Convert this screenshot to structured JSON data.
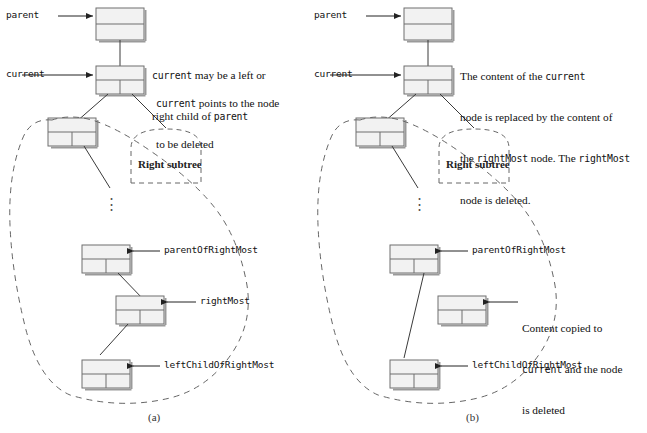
{
  "figure": {
    "colors": {
      "node_fill": "#f2f2f2",
      "node_stroke": "#6f6f6f",
      "node_shadow": "#8c8c8c",
      "line": "#3a3a3a",
      "dashed": "#666666",
      "text": "#111111",
      "background": "#ffffff"
    }
  },
  "panels": [
    {
      "id": "a",
      "caption": "(a)",
      "pointer_labels": [
        {
          "name": "parent-label",
          "text": "parent"
        },
        {
          "name": "current-label",
          "text": "current"
        },
        {
          "name": "parentofrightmost-label",
          "text": "parentOfRightMost"
        },
        {
          "name": "rightmost-label",
          "text": "rightMost"
        },
        {
          "name": "leftchildofrightmost-label",
          "text": "leftChildOfRightMost"
        }
      ],
      "subtree_label": "Right subtree",
      "annotations": [
        {
          "name": "annotation-current-child",
          "lines": [
            [
              {
                "t": "current",
                "code": true
              },
              {
                "t": " may be a left or",
                "code": false
              }
            ],
            [
              {
                "t": "right child of ",
                "code": false
              },
              {
                "t": "parent",
                "code": true
              }
            ]
          ]
        },
        {
          "name": "annotation-current-points",
          "lines": [
            [
              {
                "t": "current",
                "code": true
              },
              {
                "t": " points to the node",
                "code": false
              }
            ],
            [
              {
                "t": "to be deleted",
                "code": false
              }
            ]
          ]
        }
      ],
      "ellipsis": "⋮"
    },
    {
      "id": "b",
      "caption": "(b)",
      "pointer_labels": [
        {
          "name": "parent-label",
          "text": "parent"
        },
        {
          "name": "current-label",
          "text": "current"
        },
        {
          "name": "parentofrightmost-label",
          "text": "parentOfRightMost"
        },
        {
          "name": "leftchildofrightmost-label",
          "text": "leftChildOfRightMost"
        }
      ],
      "subtree_label": "Right subtree",
      "annotations": [
        {
          "name": "annotation-content-replaced",
          "lines": [
            [
              {
                "t": "The content of the ",
                "code": false
              },
              {
                "t": "current",
                "code": true
              }
            ],
            [
              {
                "t": "node is replaced by the content of",
                "code": false
              }
            ],
            [
              {
                "t": "the ",
                "code": false
              },
              {
                "t": "rightMost",
                "code": true
              },
              {
                "t": " node. The ",
                "code": false
              },
              {
                "t": "rightMost",
                "code": true
              }
            ],
            [
              {
                "t": "node is deleted.",
                "code": false
              }
            ]
          ]
        },
        {
          "name": "annotation-content-copied",
          "lines": [
            [
              {
                "t": "Content copied to",
                "code": false
              }
            ],
            [
              {
                "t": "current",
                "code": true
              },
              {
                "t": " and the node",
                "code": false
              }
            ],
            [
              {
                "t": "is deleted",
                "code": false
              }
            ]
          ]
        }
      ],
      "ellipsis": "⋮"
    }
  ]
}
